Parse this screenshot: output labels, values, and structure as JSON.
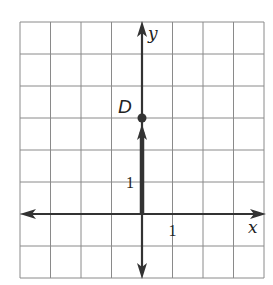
{
  "chart_data": {
    "type": "scatter",
    "title": "",
    "xlabel": "x",
    "ylabel": "y",
    "xlim": [
      -4,
      4
    ],
    "ylim": [
      -2,
      6
    ],
    "grid": true,
    "tick_labels": {
      "x": [
        "1"
      ],
      "y": [
        "1"
      ]
    },
    "points": [
      {
        "label": "D",
        "x": 0,
        "y": 3
      }
    ],
    "vectors": [
      {
        "from": [
          0,
          0
        ],
        "to": [
          0,
          3
        ]
      }
    ]
  },
  "colors": {
    "axis": "#333333",
    "grid": "#8a8a8a",
    "point": "#333333"
  }
}
